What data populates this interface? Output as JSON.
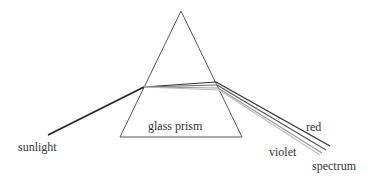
{
  "diagram": {
    "labels": {
      "prism": "glass prism",
      "input": "sunlight",
      "red": "red",
      "violet": "violet",
      "spectrum": "spectrum"
    },
    "prism": {
      "apex": [
        181,
        11
      ],
      "base_left": [
        120,
        137
      ],
      "base_right": [
        242,
        137
      ]
    },
    "incident_ray": {
      "from": [
        48,
        135
      ],
      "to": [
        144,
        87
      ],
      "color": "#222222"
    },
    "internal_rays": [
      {
        "from": [
          144,
          87
        ],
        "to": [
          216,
          82
        ],
        "color": "#333333"
      },
      {
        "from": [
          144,
          87
        ],
        "to": [
          217,
          85
        ],
        "color": "#666666"
      },
      {
        "from": [
          144,
          87
        ],
        "to": [
          218,
          88
        ],
        "color": "#999999"
      },
      {
        "from": [
          144,
          87
        ],
        "to": [
          219,
          90
        ],
        "color": "#bbbbbb"
      }
    ],
    "emergent_rays": [
      {
        "name": "red",
        "from": [
          216,
          82
        ],
        "to": [
          330,
          146
        ],
        "color": "#333333"
      },
      {
        "name": "mid1",
        "from": [
          217,
          85
        ],
        "to": [
          326,
          150
        ],
        "color": "#555555"
      },
      {
        "name": "mid2",
        "from": [
          218,
          88
        ],
        "to": [
          322,
          153
        ],
        "color": "#999999"
      },
      {
        "name": "violet",
        "from": [
          219,
          90
        ],
        "to": [
          320,
          155
        ],
        "color": "#c0c0c0"
      }
    ]
  }
}
